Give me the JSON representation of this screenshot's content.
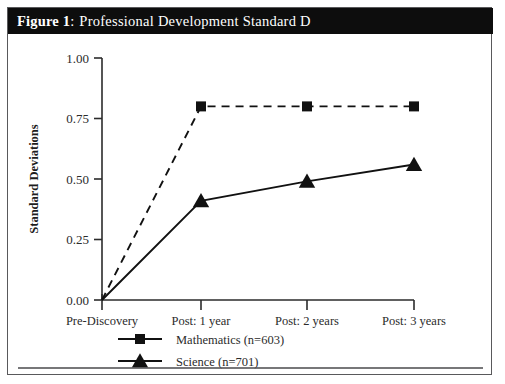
{
  "figure": {
    "label": "Figure 1",
    "colon": ":",
    "title": "Professional Development Standard D",
    "title_bar_color": "#0d0d0d",
    "title_text_color": "#ffffff",
    "frame_border_color": "#59595b"
  },
  "chart_data": {
    "type": "line",
    "title": "Professional Development Standard D",
    "xlabel": "",
    "ylabel": "Standard Deviations",
    "categories": [
      "Pre-Discovery",
      "Post: 1 year",
      "Post: 2 years",
      "Post: 3 years"
    ],
    "ylim": [
      0.0,
      1.0
    ],
    "yticks": [
      "0.00",
      "0.25",
      "0.50",
      "0.75",
      "1.00"
    ],
    "ytick_values": [
      0.0,
      0.25,
      0.5,
      0.75,
      1.0
    ],
    "grid": false,
    "legend_position": "bottom",
    "series": [
      {
        "name": "Mathematics (n=603)",
        "short_name": "Mathematics",
        "n": 603,
        "marker": "square",
        "linestyle": "dashed",
        "color": "#111111",
        "values": [
          0.0,
          0.8,
          0.8,
          0.8
        ]
      },
      {
        "name": "Science (n=701)",
        "short_name": "Science",
        "n": 701,
        "marker": "triangle",
        "linestyle": "solid",
        "color": "#111111",
        "values": [
          0.0,
          0.41,
          0.49,
          0.56
        ]
      }
    ]
  },
  "legend": {
    "items": [
      {
        "label": "Mathematics (n=603)",
        "marker": "square"
      },
      {
        "label": "Science (n=701)",
        "marker": "triangle"
      }
    ]
  }
}
